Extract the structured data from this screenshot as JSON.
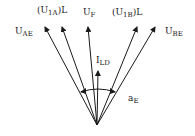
{
  "diagram": {
    "type": "phasor-diagram",
    "origin": [
      97,
      125
    ],
    "vectors": [
      {
        "id": "U_AE",
        "label_main": "U",
        "label_sub": "AE",
        "tip": [
          45,
          26
        ],
        "label_pos": [
          15,
          27
        ]
      },
      {
        "id": "(U1A)L",
        "label_prefix": "(U",
        "label_sub": "1A",
        "label_suffix": ")L",
        "tip": [
          62,
          26
        ],
        "label_pos": [
          37,
          6
        ]
      },
      {
        "id": "U_F",
        "label_main": "U",
        "label_sub": "F",
        "tip": [
          88,
          26
        ],
        "label_pos": [
          83,
          8
        ]
      },
      {
        "id": "(U1B)L",
        "label_prefix": "(U",
        "label_sub": "1B",
        "label_suffix": ")L",
        "tip": [
          137,
          26
        ],
        "label_pos": [
          112,
          8
        ]
      },
      {
        "id": "U_BE",
        "label_main": "U",
        "label_sub": "BE",
        "tip": [
          155,
          26
        ],
        "label_pos": [
          165,
          27
        ]
      },
      {
        "id": "I_LD",
        "label_main": "I",
        "label_sub": "LD",
        "tip": [
          98,
          70
        ],
        "label_pos": [
          96,
          56
        ]
      }
    ],
    "angle_label": {
      "main": "a",
      "sub": "E",
      "pos": [
        128,
        94
      ]
    },
    "stroke_color": "#1a1a1a"
  }
}
